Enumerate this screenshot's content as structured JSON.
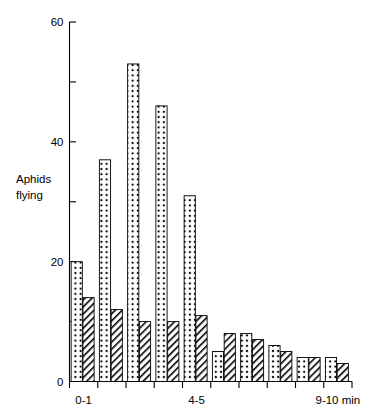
{
  "chart_data": {
    "type": "bar",
    "title": "",
    "subtitle": "",
    "xlabel": "",
    "ylabel": "Aphids flying",
    "ylabel_lines": [
      "Aphids",
      "flying"
    ],
    "ylim": [
      0,
      60
    ],
    "y_major_ticks": [
      0,
      20,
      40,
      60
    ],
    "y_minor_ticks": [
      10,
      30,
      50
    ],
    "y_ticklabels": [
      "0",
      "20",
      "40",
      "60"
    ],
    "grid": false,
    "legend": "none",
    "x_tick_count": 11,
    "categories": [
      "0-1",
      "1-2",
      "2-3",
      "3-4",
      "4-5",
      "5-6",
      "6-7",
      "7-8",
      "8-9",
      "9-10 min"
    ],
    "x_visible_labels": [
      {
        "index": 0,
        "text": "0-1"
      },
      {
        "index": 4,
        "text": "4-5"
      },
      {
        "index": 9,
        "text": "9-10 min"
      }
    ],
    "series": [
      {
        "name": "dotted",
        "pattern": "dots",
        "values": [
          20,
          37,
          53,
          46,
          31,
          5,
          8,
          6,
          4,
          4
        ]
      },
      {
        "name": "hatched",
        "pattern": "diagonal-hatch",
        "values": [
          14,
          12,
          10,
          10,
          11,
          8,
          7,
          5,
          4,
          3
        ]
      }
    ],
    "colors": {
      "outline": "#000000",
      "fill": "#ffffff",
      "pattern": "#000000"
    }
  }
}
